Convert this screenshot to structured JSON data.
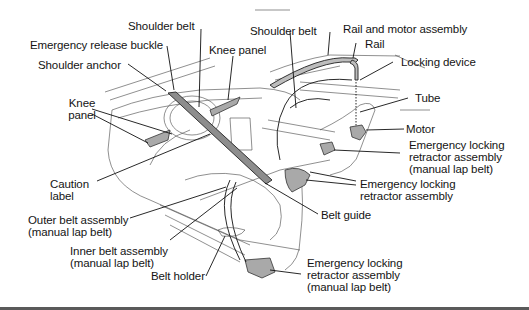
{
  "diagram": {
    "labels": {
      "shoulder_belt_left": "Shoulder belt",
      "emergency_release_buckle": "Emergency release buckle",
      "shoulder_anchor": "Shoulder  anchor",
      "knee_panel_top": "Knee panel",
      "knee_panel_left_line1": "Knee",
      "knee_panel_left_line2": "panel",
      "shoulder_belt_right": "Shoulder belt",
      "rail_and_motor_assembly": "Rail and motor assembly",
      "rail": "Rail",
      "locking_device": "Locking device",
      "tube": "Tube",
      "motor": "Motor",
      "elr_lap_right_line1": "Emergency locking",
      "elr_lap_right_line2": "retractor assembly",
      "elr_lap_right_line3": "(manual lap belt)",
      "elr_right_line1": "Emergency locking",
      "elr_right_line2": "retractor assembly",
      "caution_label_line1": "Caution",
      "caution_label_line2": "label",
      "belt_guide": "Belt guide",
      "outer_belt_line1": "Outer belt assembly",
      "outer_belt_line2": "(manual lap belt)",
      "inner_belt_line1": "Inner belt assembly",
      "inner_belt_line2": "(manual lap belt)",
      "belt_holder": "Belt holder",
      "elr_bottom_line1": "Emergency locking",
      "elr_bottom_line2": "retractor assembly",
      "elr_bottom_line3": "(manual lap belt)"
    }
  }
}
